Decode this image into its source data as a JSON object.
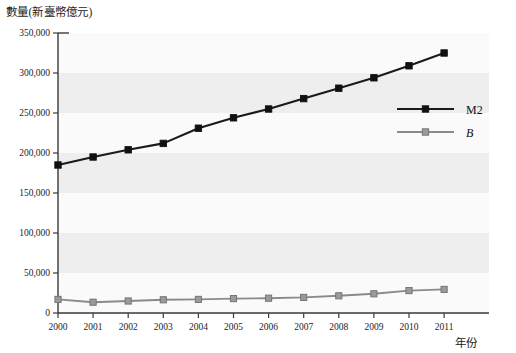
{
  "chart_data": {
    "type": "line",
    "title": "",
    "ylabel": "數量(新臺幣億元)",
    "xlabel": "年份",
    "categories": [
      "2000",
      "2001",
      "2002",
      "2003",
      "2004",
      "2005",
      "2006",
      "2007",
      "2008",
      "2009",
      "2010",
      "2011"
    ],
    "x": [
      2000,
      2001,
      2002,
      2003,
      2004,
      2005,
      2006,
      2007,
      2008,
      2009,
      2010,
      2011
    ],
    "ylim": [
      0,
      350000
    ],
    "ytick_labels": [
      "0",
      "50,000",
      "100,000",
      "150,000",
      "200,000",
      "250,000",
      "300,000",
      "350,000"
    ],
    "ytick_values": [
      0,
      50000,
      100000,
      150000,
      200000,
      250000,
      300000,
      350000
    ],
    "grid": "alternating-horizontal-bands",
    "legend_position": "right-middle",
    "series": [
      {
        "name": "M2",
        "color": "#1a1a1a",
        "marker": "square",
        "values": [
          185000,
          195000,
          204000,
          212000,
          231000,
          244000,
          255000,
          268000,
          281000,
          294000,
          309000,
          325000
        ]
      },
      {
        "name": "B",
        "color": "#8a8a8a",
        "marker": "square",
        "italic_label": true,
        "values": [
          17000,
          13500,
          15000,
          16500,
          17000,
          18000,
          18500,
          19500,
          21500,
          24000,
          28000,
          29500
        ]
      }
    ]
  },
  "legend": {
    "items": [
      {
        "label": "M2",
        "color": "#1a1a1a"
      },
      {
        "label": "B",
        "color": "#8a8a8a"
      }
    ]
  },
  "axes": {
    "y_axis_title": "數量(新臺幣億元)",
    "x_axis_title": "年份"
  }
}
